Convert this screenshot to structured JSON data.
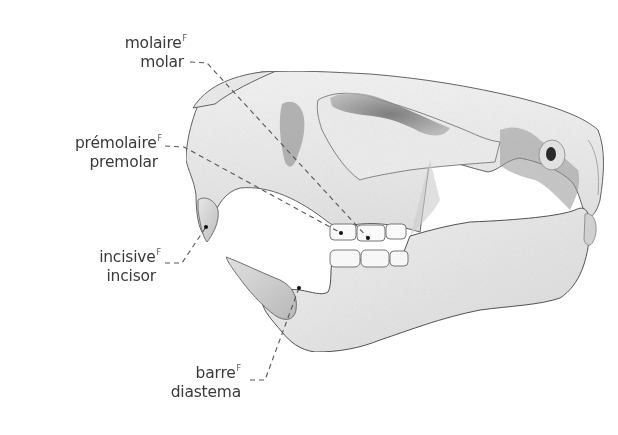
{
  "figure": {
    "colors": {
      "background": "#ffffff",
      "bone_light": "#f0f0f0",
      "bone_mid": "#d8d8d8",
      "bone_shadow": "#8a8a8a",
      "outline": "#5a5a5a",
      "leader_line": "#555555",
      "label_text": "#3a3a3a"
    }
  },
  "labels": [
    {
      "id": "molar",
      "french": "molaire",
      "french_marker": "F",
      "english": "molar",
      "anchor": [
        368,
        238
      ]
    },
    {
      "id": "premolar",
      "french": "prémolaire",
      "french_marker": "F",
      "english": "premolar",
      "anchor": [
        341,
        233
      ]
    },
    {
      "id": "incisor",
      "french": "incisive",
      "french_marker": "F",
      "english": "incisor",
      "anchor": [
        206,
        227
      ]
    },
    {
      "id": "diastema",
      "french": "barre",
      "french_marker": "F",
      "english": "diastema",
      "anchor": [
        299,
        288
      ]
    }
  ]
}
